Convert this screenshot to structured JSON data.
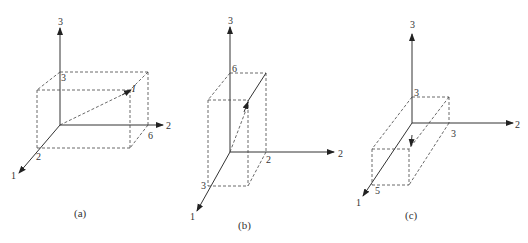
{
  "figure": {
    "panels": [
      {
        "id": "a",
        "caption": "(a)",
        "axes": {
          "x1": "1",
          "x2": "2",
          "x3": "3"
        },
        "box_labels": {
          "x1": "2",
          "x2": "6",
          "x3": "3"
        },
        "vector_label": "I"
      },
      {
        "id": "b",
        "caption": "(b)",
        "axes": {
          "x1": "1",
          "x2": "2",
          "x3": "3"
        },
        "box_labels": {
          "x1": "3",
          "x2": "2",
          "x3": "6"
        }
      },
      {
        "id": "c",
        "caption": "(c)",
        "axes": {
          "x1": "1",
          "x2": "2",
          "x3": "3"
        },
        "box_labels": {
          "x1": "5",
          "x2": "3",
          "x3": "3"
        }
      }
    ]
  }
}
